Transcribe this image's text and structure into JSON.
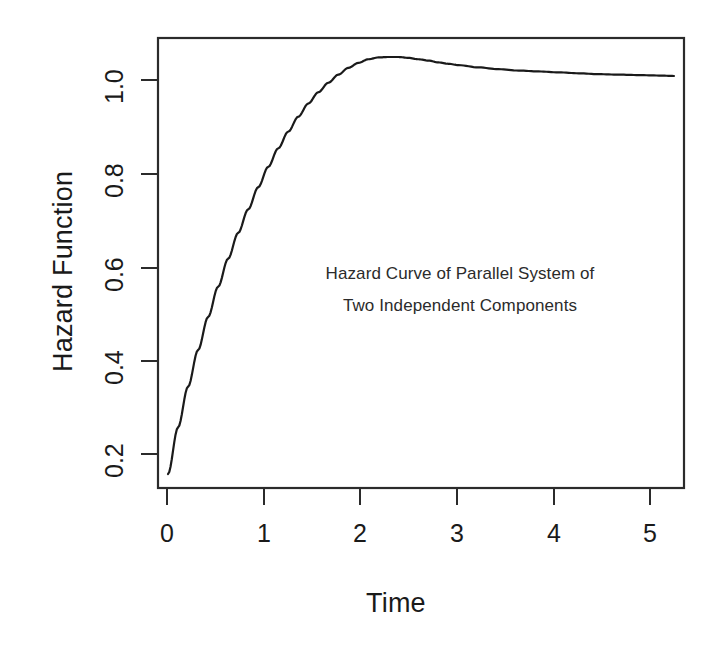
{
  "figure": {
    "width": 720,
    "height": 648,
    "background": "#ffffff",
    "foreground": "#1a1a1a",
    "line_color": "#1a1a1a"
  },
  "axes": {
    "xlabel": "Time",
    "ylabel": "Hazard Function",
    "x_ticks": [
      "0",
      "1",
      "2",
      "3",
      "4",
      "5"
    ],
    "y_ticks": [
      "0.2",
      "0.4",
      "0.6",
      "0.8",
      "1.0"
    ]
  },
  "annotation": {
    "line1": "Hazard Curve of Parallel System of",
    "line2": "Two Independent Components"
  },
  "chart_data": {
    "type": "line",
    "title": "",
    "annotation": [
      "Hazard Curve of Parallel System of",
      "Two Independent Components"
    ],
    "xlabel": "Time",
    "ylabel": "Hazard Function",
    "xlim": [
      0.0,
      5.25
    ],
    "ylim": [
      0.1,
      1.095
    ],
    "xticks": [
      0,
      1,
      2,
      3,
      4,
      5
    ],
    "yticks": [
      0.2,
      0.4,
      0.6,
      0.8,
      1.0
    ],
    "grid": false,
    "legend": null,
    "box": "full-rectangle",
    "series": [
      {
        "name": "Hazard function h(t)",
        "color": "#1a1a1a",
        "linewidth": 2.2,
        "x": [
          0.1,
          0.2,
          0.3,
          0.4,
          0.5,
          0.6,
          0.7,
          0.8,
          0.9,
          1.0,
          1.1,
          1.2,
          1.3,
          1.4,
          1.5,
          1.6,
          1.7,
          1.8,
          1.9,
          2.0,
          2.1,
          2.2,
          2.3,
          2.4,
          2.5,
          2.6,
          2.7,
          2.8,
          2.9,
          3.0,
          3.2,
          3.4,
          3.6,
          3.8,
          4.0,
          4.2,
          4.4,
          4.6,
          4.8,
          5.0,
          5.15
        ],
        "y": [
          0.131,
          0.234,
          0.324,
          0.405,
          0.478,
          0.545,
          0.607,
          0.664,
          0.716,
          0.765,
          0.81,
          0.851,
          0.888,
          0.921,
          0.95,
          0.975,
          0.996,
          1.014,
          1.029,
          1.04,
          1.048,
          1.052,
          1.053,
          1.053,
          1.051,
          1.048,
          1.045,
          1.041,
          1.038,
          1.035,
          1.03,
          1.026,
          1.023,
          1.021,
          1.019,
          1.017,
          1.015,
          1.014,
          1.013,
          1.012,
          1.011
        ]
      }
    ],
    "notes": {
      "start_point": {
        "x": 0.1,
        "y": 0.131
      },
      "peak": {
        "x": 2.25,
        "y": 1.053
      },
      "end_point": {
        "x": 5.15,
        "y": 1.011
      },
      "asymptote": 1.0
    }
  }
}
